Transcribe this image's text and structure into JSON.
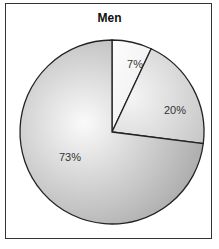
{
  "chart_data": {
    "type": "pie",
    "title": "Men",
    "categories": [
      "",
      "",
      ""
    ],
    "values": [
      7,
      20,
      73
    ],
    "labels": [
      "7%",
      "20%",
      "73%"
    ],
    "start_angle": "12 o'clock, clockwise",
    "colors": [
      "#f3f3f3",
      "#dcdcdc",
      "#c4c4c4"
    ]
  }
}
